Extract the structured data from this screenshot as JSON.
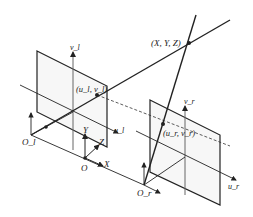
{
  "diagram": {
    "type": "stereo-camera-geometry",
    "labels": {
      "world_point": "(X, Y, Z)",
      "left_image_point": "(u_l, v_l)",
      "right_image_point": "(u_r, v_r)",
      "left_v_axis": "v_l",
      "left_u_axis": "u_l",
      "right_v_axis": "v_r",
      "right_u_axis": "u_r",
      "left_origin": "O_l",
      "right_origin": "O_r",
      "world_origin": "O",
      "world_x": "X",
      "world_y": "Y",
      "world_z": "Z"
    },
    "colors": {
      "line": "#222222",
      "axis": "#555555",
      "plane_fill": "#f7f7f7"
    }
  }
}
